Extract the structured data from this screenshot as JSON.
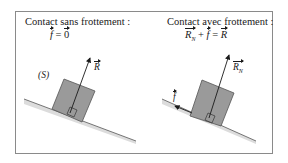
{
  "panels": [
    {
      "title": "Contact sans frottement :",
      "equation": {
        "lhs": "f",
        "op": "=",
        "rhs": "0"
      },
      "labels": {
        "solid": "(S)",
        "force": "R"
      }
    },
    {
      "title": "Contact avec frottement :",
      "equation": {
        "t1": "R",
        "t1_sub": "N",
        "plus": "+",
        "t2": "f",
        "op": "=",
        "rhs": "R"
      },
      "labels": {
        "force": "R",
        "force_sub": "N",
        "friction": "f"
      }
    }
  ],
  "colors": {
    "block": "#9a9a9a",
    "block_stroke": "#555555",
    "incline": "#dcdcdc",
    "frame": "#8a8a8a",
    "ink": "#1a1a1a"
  }
}
